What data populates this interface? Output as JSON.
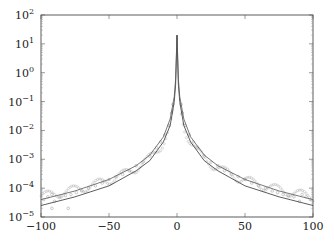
{
  "chart_data": {
    "type": "line",
    "title": "",
    "xlabel": "",
    "ylabel": "",
    "xlim": [
      -100,
      100
    ],
    "ylim": [
      1e-05,
      100
    ],
    "yscale": "log",
    "grid": false,
    "legend": null,
    "x_ticks": [
      -100,
      -50,
      0,
      50,
      100
    ],
    "x_tick_labels": [
      "−100",
      "−50",
      "0",
      "50",
      "100"
    ],
    "y_ticks": [
      100,
      10,
      1,
      0.1,
      0.01,
      0.001,
      0.0001,
      1e-05
    ],
    "y_tick_labels": [
      {
        "base": "10",
        "exp": "2"
      },
      {
        "base": "10",
        "exp": "1"
      },
      {
        "base": "10",
        "exp": "0"
      },
      {
        "base": "10",
        "exp": "−1"
      },
      {
        "base": "10",
        "exp": "−2"
      },
      {
        "base": "10",
        "exp": "−3"
      },
      {
        "base": "10",
        "exp": "−4"
      },
      {
        "base": "10",
        "exp": "−5"
      }
    ],
    "series": [
      {
        "name": "model curve (lower)",
        "style": "solid",
        "color": "#333333",
        "x": [
          -100,
          -75,
          -50,
          -30,
          -20,
          -10,
          -5,
          -2,
          -1,
          0,
          1,
          2,
          5,
          10,
          20,
          30,
          50,
          75,
          100
        ],
        "y": [
          2.5e-05,
          5e-05,
          0.00012,
          0.0004,
          0.0009,
          0.004,
          0.015,
          0.1,
          0.4,
          20,
          0.4,
          0.1,
          0.015,
          0.004,
          0.0009,
          0.0004,
          0.00012,
          5e-05,
          2.5e-05
        ]
      },
      {
        "name": "model curve (upper)",
        "style": "solid",
        "color": "#555555",
        "x": [
          -100,
          -75,
          -50,
          -30,
          -20,
          -10,
          -5,
          -2,
          -1,
          0,
          1,
          2,
          5,
          10,
          20,
          30,
          50,
          75,
          100
        ],
        "y": [
          4e-05,
          8e-05,
          0.0002,
          0.0006,
          0.0014,
          0.006,
          0.025,
          0.15,
          0.6,
          20,
          0.6,
          0.15,
          0.025,
          0.006,
          0.0014,
          0.0006,
          0.0002,
          8e-05,
          4e-05
        ]
      },
      {
        "name": "samples",
        "style": "scatter",
        "marker": "circle-open",
        "color": "#999999",
        "x": [
          -98,
          -95,
          -92,
          -90,
          -86,
          -82,
          -78,
          -74,
          -70,
          -65,
          -60,
          -55,
          -50,
          -45,
          -40,
          -35,
          -30,
          -25,
          -20,
          -15,
          -12,
          -9,
          -6,
          -4,
          -3,
          3,
          4,
          6,
          9,
          12,
          15,
          20,
          25,
          30,
          35,
          40,
          45,
          50,
          55,
          60,
          65,
          70,
          74,
          78,
          82,
          86,
          90,
          92,
          95,
          98
        ],
        "y": [
          4e-05,
          5e-05,
          6e-05,
          3.5e-05,
          5e-05,
          5.5e-05,
          6e-05,
          7e-05,
          8e-05,
          0.0001,
          0.00012,
          0.00015,
          0.0002,
          0.00025,
          0.0003,
          0.0004,
          0.0006,
          0.0008,
          0.0013,
          0.0025,
          0.004,
          0.007,
          0.015,
          0.04,
          0.08,
          0.08,
          0.04,
          0.015,
          0.007,
          0.004,
          0.0025,
          0.0013,
          0.0008,
          0.0006,
          0.0004,
          0.0003,
          0.00025,
          0.0002,
          0.00015,
          0.00012,
          0.0001,
          8e-05,
          7e-05,
          6e-05,
          5.5e-05,
          5e-05,
          3.5e-05,
          6e-05,
          5e-05,
          4e-05
        ]
      }
    ],
    "outliers": [
      {
        "x": -80,
        "y": 2e-05
      },
      {
        "x": -92,
        "y": 2e-05
      }
    ]
  },
  "caption_fragment": "(clipped caption text, illegible)"
}
